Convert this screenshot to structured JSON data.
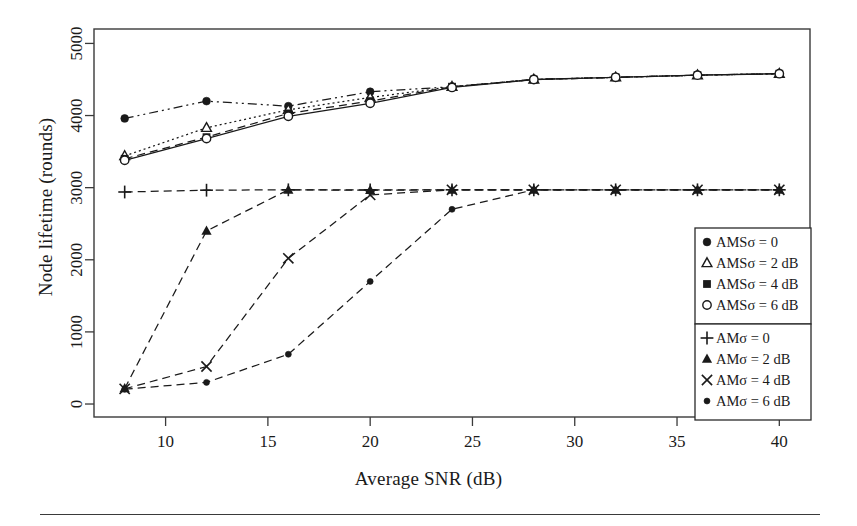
{
  "chart_data": {
    "type": "line",
    "title": "",
    "xlabel": "Average SNR (dB)",
    "ylabel": "Node lifetime (rounds)",
    "xlim": [
      6.5,
      41.5
    ],
    "ylim": [
      -180,
      5200
    ],
    "xticks": [
      10,
      15,
      20,
      25,
      30,
      35,
      40
    ],
    "xticklabels": [
      "10",
      "15",
      "20",
      "25",
      "30",
      "35",
      "40"
    ],
    "yticks": [
      0,
      1000,
      2000,
      3000,
      4000,
      5000
    ],
    "yticklabels": [
      "0",
      "1000",
      "2000",
      "3000",
      "4000",
      "5000"
    ],
    "grid": false,
    "legend_position": "lower right",
    "x": [
      8,
      12,
      16,
      20,
      24,
      28,
      32,
      36,
      40
    ],
    "series": [
      {
        "name": "AMSσ = 0",
        "label": "AMSσ = 0",
        "marker": "filled-circle",
        "dash": "dashdotdot",
        "values": [
          3960,
          4200,
          4130,
          4330,
          4400,
          4500,
          4530,
          4560,
          4580
        ]
      },
      {
        "name": "AMSσ = 2 dB",
        "label": "AMSσ = 2 dB",
        "marker": "open-triangle",
        "dash": "dotted",
        "values": [
          3440,
          3830,
          4080,
          4250,
          4400,
          4500,
          4530,
          4560,
          4580
        ]
      },
      {
        "name": "AMSσ = 4 dB",
        "label": "AMSσ = 4 dB",
        "marker": "filled-square",
        "dash": "dashed",
        "values": [
          3400,
          3700,
          4030,
          4200,
          4400,
          4500,
          4530,
          4560,
          4580
        ]
      },
      {
        "name": "AMSσ = 6 dB",
        "label": "AMSσ = 6 dB",
        "marker": "open-circle",
        "dash": "solid",
        "values": [
          3380,
          3680,
          3990,
          4170,
          4390,
          4500,
          4530,
          4560,
          4580
        ]
      },
      {
        "name": "AMσ = 0",
        "label": "AMσ = 0",
        "marker": "plus",
        "dash": "dashed",
        "values": [
          2940,
          2965,
          2970,
          2970,
          2970,
          2970,
          2970,
          2970,
          2970
        ]
      },
      {
        "name": "AMσ = 2 dB",
        "label": "AMσ = 2 dB",
        "marker": "filled-triangle",
        "dash": "dashed",
        "values": [
          215,
          2400,
          2970,
          2965,
          2970,
          2970,
          2970,
          2970,
          2970
        ]
      },
      {
        "name": "AMσ = 4 dB",
        "label": "AMσ = 4 dB",
        "marker": "cross",
        "dash": "dashed",
        "values": [
          210,
          520,
          2020,
          2900,
          2970,
          2970,
          2970,
          2970,
          2970
        ]
      },
      {
        "name": "AMσ = 6 dB",
        "label": "AMσ = 6 dB",
        "marker": "small-filled-circle",
        "dash": "dashed",
        "values": [
          205,
          300,
          690,
          1700,
          2700,
          2970,
          2970,
          2970,
          2970
        ]
      }
    ],
    "legend_groups": [
      {
        "entries": [
          {
            "marker": "filled-circle",
            "label": "AMSσ = 0"
          },
          {
            "marker": "open-triangle",
            "label": "AMSσ = 2 dB"
          },
          {
            "marker": "filled-square",
            "label": "AMSσ = 4 dB"
          },
          {
            "marker": "open-circle",
            "label": "AMSσ = 6 dB"
          }
        ]
      },
      {
        "entries": [
          {
            "marker": "plus",
            "label": "AMσ = 0"
          },
          {
            "marker": "filled-triangle",
            "label": "AMσ = 2 dB"
          },
          {
            "marker": "cross",
            "label": "AMσ = 4 dB"
          },
          {
            "marker": "small-filled-circle",
            "label": "AMσ = 6 dB"
          }
        ]
      }
    ]
  },
  "colors": {
    "ink": "#1a1a1a",
    "axis": "#3a3a3a",
    "background": "#ffffff"
  }
}
